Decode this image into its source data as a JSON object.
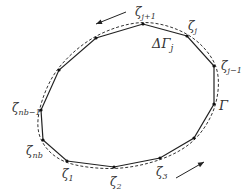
{
  "diagram": {
    "contour_label": "Γ",
    "segment_label": "ΔΓ",
    "segment_sub": "j",
    "vertices": [
      {
        "id": "zeta_1",
        "label": "ζ",
        "sub": "1",
        "x": 67,
        "y": 161,
        "lx": 62,
        "ly": 178
      },
      {
        "id": "zeta_2",
        "label": "ζ",
        "sub": "2",
        "x": 114,
        "y": 167,
        "lx": 110,
        "ly": 186
      },
      {
        "id": "zeta_3",
        "label": "ζ",
        "sub": "3",
        "x": 160,
        "y": 158,
        "lx": 156,
        "ly": 176
      },
      {
        "id": "v4",
        "label": "",
        "sub": "",
        "x": 194,
        "y": 138
      },
      {
        "id": "v5",
        "label": "",
        "sub": "",
        "x": 214,
        "y": 104
      },
      {
        "id": "zeta_j_minus_1",
        "label": "ζ",
        "sub": "j−1",
        "x": 214,
        "y": 66,
        "lx": 221,
        "ly": 70
      },
      {
        "id": "zeta_j",
        "label": "ζ",
        "sub": "j",
        "x": 187,
        "y": 36,
        "lx": 188,
        "ly": 30
      },
      {
        "id": "zeta_j_plus_1",
        "label": "ζ",
        "sub": "j+1",
        "x": 143,
        "y": 24,
        "lx": 135,
        "ly": 16
      },
      {
        "id": "v9",
        "label": "",
        "sub": "",
        "x": 96,
        "y": 38
      },
      {
        "id": "v10",
        "label": "",
        "sub": "",
        "x": 59,
        "y": 70
      },
      {
        "id": "zeta_nb_minus_1",
        "label": "ζ",
        "sub": "nb−1",
        "x": 41,
        "y": 110,
        "lx": 12,
        "ly": 112
      },
      {
        "id": "zeta_nb",
        "label": "ζ",
        "sub": "nb",
        "x": 43,
        "y": 140,
        "lx": 26,
        "ly": 155
      }
    ],
    "arrows": [
      {
        "id": "arrow-top",
        "direction": "counterclockwise",
        "x1": 126,
        "y1": 12,
        "x2": 96,
        "y2": 24
      },
      {
        "id": "arrow-bottom",
        "direction": "counterclockwise",
        "x1": 176,
        "y1": 178,
        "x2": 204,
        "y2": 162
      }
    ],
    "colors": {
      "polygon": "#222222",
      "curve": "#333333",
      "vertex": "#111111"
    }
  }
}
